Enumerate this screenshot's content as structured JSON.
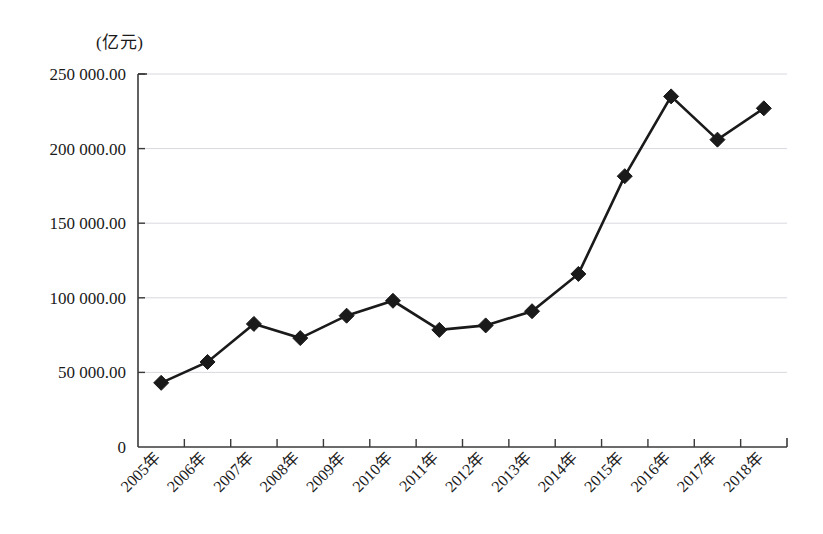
{
  "chart_data": {
    "type": "line",
    "title": "",
    "subtitle": "",
    "xlabel": "",
    "ylabel": "",
    "unit_label": "(亿元)",
    "grid": true,
    "legend": false,
    "legend_position": "none",
    "ylim": [
      0,
      250000
    ],
    "yticks": [
      0,
      50000,
      100000,
      150000,
      200000,
      250000
    ],
    "ytick_labels": [
      "0",
      "50 000.00",
      "100 000.00",
      "150 000.00",
      "200 000.00",
      "250 000.00"
    ],
    "categories": [
      "2005年",
      "2006年",
      "2007年",
      "2008年",
      "2009年",
      "2010年",
      "2011年",
      "2012年",
      "2013年",
      "2014年",
      "2015年",
      "2016年",
      "2017年",
      "2018年"
    ],
    "series": [
      {
        "name": "",
        "marker": "diamond",
        "color": "#1a1a1a",
        "values": [
          43000,
          57000,
          82500,
          73000,
          88000,
          98000,
          78500,
          81500,
          91000,
          116000,
          181500,
          235000,
          206000,
          227000
        ]
      }
    ]
  },
  "colors": {
    "line": "#1a1a1a",
    "marker": "#1a1a1a",
    "grid": "#d8d8e0",
    "axis": "#3a3a3a",
    "text": "#1a1a1a",
    "background": "#ffffff"
  }
}
